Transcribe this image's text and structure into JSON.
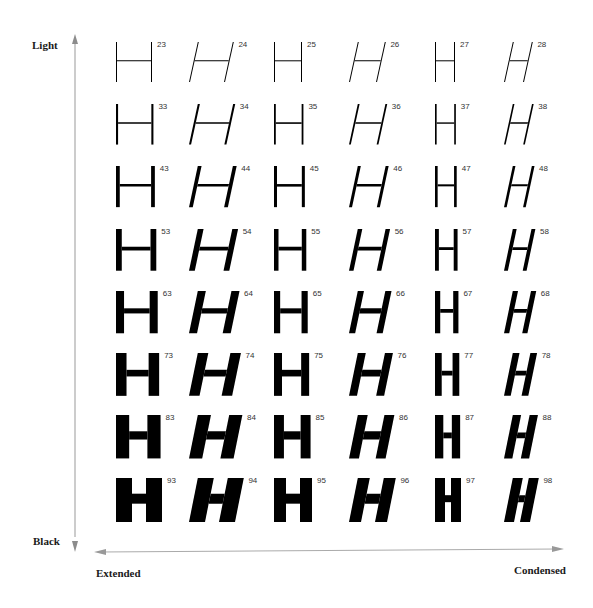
{
  "axes": {
    "vertical": {
      "top_label": "Light",
      "bottom_label": "Black",
      "color": "#8c8c8c"
    },
    "horizontal": {
      "left_label": "Extended",
      "right_label": "Condensed",
      "color": "#a0a0a0"
    }
  },
  "glyph_character": "H",
  "glyph_color": "#000000",
  "columns": [
    {
      "width_class": "extended",
      "italic": false
    },
    {
      "width_class": "extended",
      "italic": true
    },
    {
      "width_class": "normal",
      "italic": false
    },
    {
      "width_class": "normal",
      "italic": true
    },
    {
      "width_class": "condensed",
      "italic": false
    },
    {
      "width_class": "condensed",
      "italic": true
    }
  ],
  "rows": [
    {
      "weight_level": 1,
      "labels": [
        "23",
        "24",
        "25",
        "26",
        "27",
        "28"
      ]
    },
    {
      "weight_level": 2,
      "labels": [
        "33",
        "34",
        "35",
        "36",
        "37",
        "38"
      ]
    },
    {
      "weight_level": 3,
      "labels": [
        "43",
        "44",
        "45",
        "46",
        "47",
        "48"
      ]
    },
    {
      "weight_level": 4,
      "labels": [
        "53",
        "54",
        "55",
        "56",
        "57",
        "58"
      ]
    },
    {
      "weight_level": 5,
      "labels": [
        "63",
        "64",
        "65",
        "66",
        "67",
        "68"
      ]
    },
    {
      "weight_level": 6,
      "labels": [
        "73",
        "74",
        "75",
        "76",
        "77",
        "78"
      ]
    },
    {
      "weight_level": 7,
      "labels": [
        "83",
        "84",
        "85",
        "86",
        "87",
        "88"
      ]
    },
    {
      "weight_level": 8,
      "labels": [
        "93",
        "94",
        "95",
        "96",
        "97",
        "98"
      ]
    }
  ]
}
